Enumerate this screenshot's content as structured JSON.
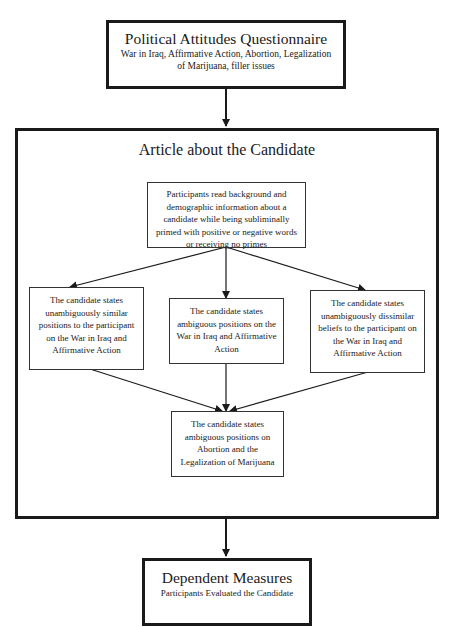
{
  "diagram": {
    "top_box": {
      "title": "Political Attitudes Questionnaire",
      "subtitle": "War in Iraq, Affirmative Action, Abortion, Legalization of Marijuana, filler issues"
    },
    "article_section": {
      "title": "Article about the Candidate",
      "intro_box": "Participants read background and demographic information about a candidate while being subliminally primed with positive or negative words or receiving no primes",
      "conditions": [
        {
          "text": "The candidate states unambiguously similar positions to the participant on the War in Iraq and Affirmative Action"
        },
        {
          "text": "The candidate states ambiguous positions on the War in Iraq and Affirmative Action"
        },
        {
          "text": "The candidate states unambiguously dissimilar beliefs to the participant on the War in Iraq and Affirmative Action"
        }
      ],
      "final_box": "The candidate states ambiguous positions on Abortion and the Legalization of Marijuana"
    },
    "bottom_box": {
      "title": "Dependent Measures",
      "subtitle": "Participants Evaluated the Candidate"
    },
    "colors": {
      "line": "#1a1a1a",
      "background": "#ffffff"
    }
  }
}
